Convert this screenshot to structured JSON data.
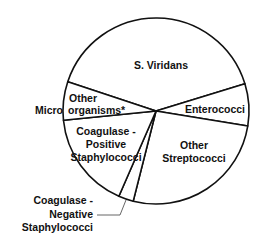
{
  "chart_data": {
    "type": "pie",
    "title": "",
    "start_angle_deg": -71.6,
    "direction": "clockwise",
    "center": [
      156,
      111
    ],
    "radius": 93,
    "categories": [
      "S. Viridans",
      "Enterococci",
      "Other Streptococci",
      "Coagulase-Negative Staphylococci",
      "Coagulase-Positive Staphylococci",
      "Other Microorganisms*"
    ],
    "values": [
      40.2,
      7.3,
      26.4,
      2.6,
      16.9,
      6.7
    ],
    "unit": "% (estimated from slice angles)",
    "fill": "#ffffff",
    "stroke": "#111111",
    "legend": "none (labels placed on/near slices)",
    "annotations": [
      "* on Other Microorganisms",
      "leader line for Coagulase-Negative Staphylococci"
    ]
  },
  "labels": {
    "s_viridans": [
      "S. Viridans"
    ],
    "enterococci": [
      "Enterococci"
    ],
    "other_strep": [
      "Other",
      "Streptococci"
    ],
    "coag_pos": [
      "Coagulase -",
      "Positive",
      "Staphylococci"
    ],
    "coag_neg": [
      "Coagulase -",
      "Negative",
      "Staphylococci"
    ],
    "other_micro": [
      "Other",
      "Micro",
      "organisms*"
    ]
  }
}
